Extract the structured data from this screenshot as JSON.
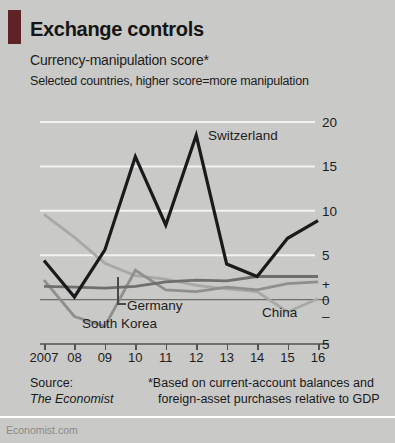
{
  "header": {
    "title": "Exchange controls",
    "subtitle": "Currency-manipulation score*",
    "subtitle2": "Selected countries, higher score=more manipulation"
  },
  "footer": {
    "source_label": "Source:",
    "source_name": "The Economist",
    "note_line1": "*Based on current-account balances and",
    "note_line2": "foreign-asset purchases relative to GDP",
    "watermark": "Economist.com"
  },
  "colors": {
    "background": "#c9c9c7",
    "tab_marker": "#5d2327",
    "gridline": "#f2f2f0",
    "axis": "#55554f",
    "switzerland": "#1a1a1a",
    "germany": "#6f6f6d",
    "south_korea": "#8f8f8d",
    "china": "#a8a8a4"
  },
  "chart_data": {
    "type": "line",
    "title": "Exchange controls",
    "subtitle": "Currency-manipulation score*",
    "xlabel": "",
    "ylabel": "",
    "ylim": [
      -5,
      20
    ],
    "xlim": [
      2007,
      2016
    ],
    "grid": true,
    "legend": "inline-labels",
    "x": [
      2007,
      2008,
      2009,
      2010,
      2011,
      2012,
      2013,
      2014,
      2015,
      2016
    ],
    "ytick_labels": [
      "20",
      "15",
      "10",
      "5",
      "+",
      "0",
      "–",
      "5"
    ],
    "ytick_values": [
      20,
      15,
      10,
      5,
      1.8,
      0,
      -1.8,
      -5
    ],
    "xtick_labels": [
      "2007",
      "08",
      "09",
      "10",
      "11",
      "12",
      "13",
      "14",
      "15",
      "16"
    ],
    "series": [
      {
        "name": "Switzerland",
        "color": "#1a1a1a",
        "width": 3.2,
        "values": [
          4.4,
          0.3,
          5.6,
          16.1,
          8.4,
          18.5,
          4.0,
          2.6,
          6.9,
          8.9
        ]
      },
      {
        "name": "Germany",
        "color": "#6f6f6d",
        "width": 2.8,
        "values": [
          1.5,
          1.4,
          1.3,
          1.5,
          2.0,
          2.2,
          2.1,
          2.6,
          2.6,
          2.6
        ]
      },
      {
        "name": "South Korea",
        "color": "#8f8f8d",
        "width": 2.8,
        "values": [
          2.2,
          -1.9,
          -3.0,
          3.3,
          1.1,
          0.9,
          1.4,
          1.1,
          1.8,
          2.0
        ]
      },
      {
        "name": "China",
        "color": "#a8a8a4",
        "width": 2.8,
        "values": [
          9.6,
          7.0,
          4.1,
          2.7,
          2.3,
          1.6,
          1.2,
          0.9,
          -1.4,
          0.1
        ]
      }
    ],
    "annotations": [
      {
        "text": "Switzerland",
        "x": 2012,
        "y": 18.5,
        "position": "right"
      },
      {
        "text": "Germany",
        "x": 2010,
        "y": 1.5,
        "position": "below-leader"
      },
      {
        "text": "South Korea",
        "x": 2009,
        "y": -3.0,
        "position": "below"
      },
      {
        "text": "China",
        "x": 2014.5,
        "y": -1.4,
        "position": "below"
      }
    ]
  }
}
